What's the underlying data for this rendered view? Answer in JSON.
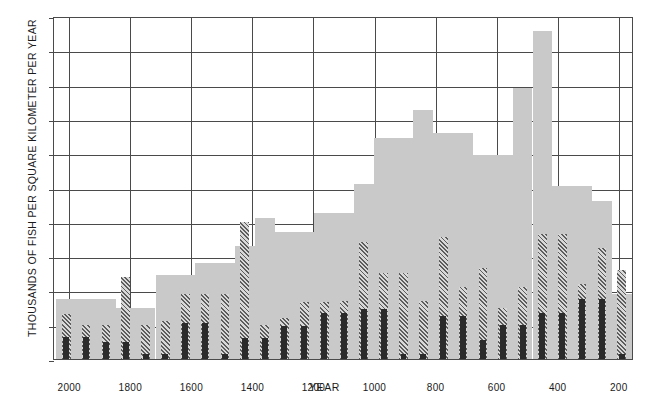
{
  "chart_data": {
    "type": "bar",
    "title": "",
    "subtitle": "",
    "xlabel": "YEAR",
    "ylabel": "THOUSANDS OF FISH PER SQUARE KILOMETER PER YEAR",
    "grid": true,
    "legend": "none",
    "orientation": "vertical",
    "bar_style": "overlapping-layers",
    "x_axis": {
      "reversed": true,
      "min": 2050,
      "max": 150,
      "tick_labels": [
        "2000",
        "1800",
        "1600",
        "1400",
        "1200",
        "1000",
        "800",
        "600",
        "400",
        "200"
      ],
      "tick_values": [
        2000,
        1800,
        1600,
        1400,
        1200,
        1000,
        800,
        600,
        400,
        200
      ]
    },
    "y_axis": {
      "min": 0,
      "max": 200,
      "tick_labels": [
        "0",
        "20",
        "40",
        "60",
        "80",
        "100",
        "120",
        "140",
        "160",
        "180",
        "200"
      ],
      "tick_values": [
        0,
        20,
        40,
        60,
        80,
        100,
        120,
        140,
        160,
        180,
        200
      ]
    },
    "x": [
      2010,
      1945,
      1880,
      1815,
      1750,
      1685,
      1620,
      1555,
      1490,
      1425,
      1360,
      1295,
      1230,
      1165,
      1100,
      1035,
      970,
      905,
      840,
      775,
      710,
      645,
      580,
      515,
      450,
      385,
      320,
      255,
      190
    ],
    "bar_width_years": 65,
    "series": [
      {
        "name": "light-gray-series",
        "color": "#c9c9c9",
        "values": [
          35,
          35,
          35,
          30,
          30,
          49,
          49,
          56,
          56,
          66,
          82,
          74,
          74,
          85,
          85,
          102,
          129,
          129,
          145,
          132,
          132,
          119,
          119,
          158,
          191,
          101,
          101,
          92,
          38
        ]
      },
      {
        "name": "hatched-series",
        "color": "#5d5d5d",
        "values": [
          26,
          20,
          20,
          48,
          20,
          22,
          38,
          38,
          38,
          80,
          20,
          24,
          33,
          33,
          34,
          68,
          50,
          50,
          34,
          71,
          42,
          53,
          30,
          42,
          73,
          73,
          44,
          65,
          52
        ]
      },
      {
        "name": "dark-solid-series",
        "color": "#2b2b2b",
        "values": [
          13,
          13,
          10,
          10,
          3,
          3,
          21,
          21,
          3,
          12,
          12,
          19,
          19,
          27,
          27,
          29,
          29,
          3,
          3,
          25,
          25,
          11,
          20,
          20,
          27,
          27,
          35,
          35,
          3
        ]
      }
    ]
  }
}
